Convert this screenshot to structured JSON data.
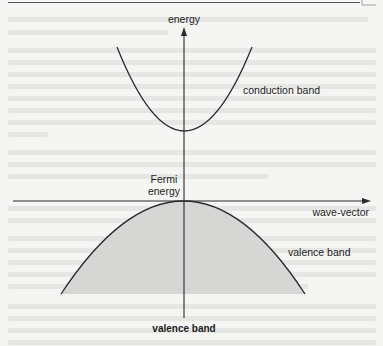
{
  "diagram": {
    "type": "band-structure",
    "axes": {
      "vertical_label": "energy",
      "horizontal_label": "wave-vector"
    },
    "labels": {
      "energy_axis": "energy",
      "wave_vector_axis": "wave-vector",
      "conduction_band": "conduction band",
      "valence_band_curve": "valence band",
      "valence_band_caption": "valence band",
      "fermi_line1": "Fermi",
      "fermi_line2": "energy"
    },
    "colors": {
      "background": "#f5f5f4",
      "line": "#2a2a2a",
      "valence_fill": "#d6d6d5",
      "ghost_text": "#e6e6e4"
    },
    "geometry": {
      "vertical_axis": {
        "x": 184,
        "y_top": 28,
        "y_bottom": 318
      },
      "horizontal_axis": {
        "y": 201,
        "x_left": 13,
        "x_right": 370
      },
      "conduction_band": {
        "apex": [
          184,
          131
        ],
        "left_end": [
          117,
          47
        ],
        "right_end": [
          252,
          47
        ]
      },
      "valence_band": {
        "apex": [
          184,
          201
        ],
        "left_end": [
          61,
          294
        ],
        "right_end": [
          305,
          294
        ]
      }
    }
  }
}
